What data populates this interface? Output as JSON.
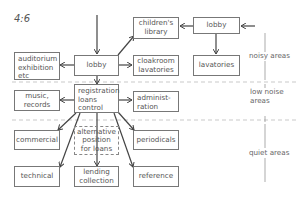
{
  "figure_label": "4:6",
  "boxes": {
    "lobby_main": "lobby",
    "childrens_library": "children's library",
    "lobby_entrance": "lobby",
    "auditorium": "auditorium exhibition etc",
    "cloakroom": "cloakroom lavatories",
    "lavatories": "lavatories",
    "registration": "registration loans control",
    "music": "music, records",
    "administration": "administ- ration",
    "commercial": "commercial",
    "alternative": "alternative position for loans",
    "periodicals": "periodicals",
    "technical": "technical",
    "lending": "lending collection",
    "reference": "reference"
  },
  "zones": {
    "noisy": "noisy areas",
    "low_noise_line1": "low noise",
    "low_noise_line2": "areas",
    "quiet": "quiet areas"
  },
  "colors": {
    "line": "#555555",
    "box_border": "#777777",
    "dashed": "#aaaaaa"
  }
}
